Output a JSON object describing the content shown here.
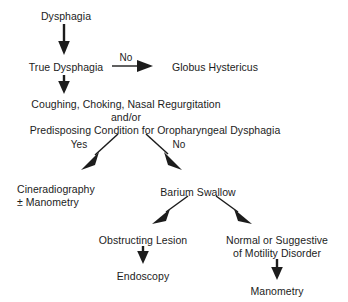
{
  "diagram": {
    "ink_color": "#1c1c1c",
    "background_color": "#ffffff",
    "nodes": [
      {
        "id": "dysphagia",
        "text": "Dysphagia",
        "x": 66,
        "y": 10,
        "align": "center"
      },
      {
        "id": "true-dysphagia",
        "text": "True Dysphagia",
        "x": 66,
        "y": 61,
        "align": "center"
      },
      {
        "id": "globus",
        "text": "Globus Hystericus",
        "x": 215,
        "y": 61,
        "align": "center"
      },
      {
        "id": "symptoms-line1",
        "text": "Coughing, Choking, Nasal Regurgitation",
        "x": 126,
        "y": 98,
        "align": "center"
      },
      {
        "id": "symptoms-line2",
        "text": "and/or",
        "x": 126,
        "y": 111,
        "align": "center"
      },
      {
        "id": "symptoms-line3",
        "text": "Predisposing Condition for Oropharyngeal Dysphagia",
        "x": 155,
        "y": 124,
        "align": "center"
      },
      {
        "id": "cineradiography",
        "text": "Cineradiography",
        "x": 17,
        "y": 183,
        "align": "left"
      },
      {
        "id": "manometry-pm",
        "text": "± Manometry",
        "x": 17,
        "y": 196,
        "align": "left"
      },
      {
        "id": "barium-swallow",
        "text": "Barium Swallow",
        "x": 198,
        "y": 186,
        "align": "center"
      },
      {
        "id": "obstructing",
        "text": "Obstructing Lesion",
        "x": 143,
        "y": 234,
        "align": "center"
      },
      {
        "id": "endoscopy",
        "text": "Endoscopy",
        "x": 143,
        "y": 270,
        "align": "center"
      },
      {
        "id": "normal-line1",
        "text": "Normal or Suggestive",
        "x": 277,
        "y": 234,
        "align": "center"
      },
      {
        "id": "normal-line2",
        "text": "of Motility Disorder",
        "x": 277,
        "y": 247,
        "align": "center"
      },
      {
        "id": "manometry",
        "text": "Manometry",
        "x": 277,
        "y": 285,
        "align": "center"
      }
    ],
    "edge_labels": [
      {
        "id": "no-globus",
        "text": "No",
        "x": 126,
        "y": 52
      },
      {
        "id": "yes-branch",
        "text": "Yes",
        "x": 79,
        "y": 139
      },
      {
        "id": "no-branch",
        "text": "No",
        "x": 179,
        "y": 139
      }
    ],
    "edges": [
      {
        "id": "dysphagia-to-true",
        "from": "dysphagia",
        "to": "true-dysphagia",
        "kind": "vertical",
        "label": ""
      },
      {
        "id": "true-to-globus",
        "from": "true-dysphagia",
        "to": "globus",
        "kind": "horizontal",
        "label": "No"
      },
      {
        "id": "true-to-symptoms",
        "from": "true-dysphagia",
        "to": "symptoms-line1",
        "kind": "vertical",
        "label": ""
      },
      {
        "id": "symptoms-to-cineradiography",
        "from": "symptoms-line3",
        "to": "cineradiography",
        "kind": "diagonal-left",
        "label": "Yes"
      },
      {
        "id": "symptoms-to-barium",
        "from": "symptoms-line3",
        "to": "barium-swallow",
        "kind": "diagonal-right",
        "label": "No"
      },
      {
        "id": "barium-to-obstructing",
        "from": "barium-swallow",
        "to": "obstructing",
        "kind": "diagonal-left",
        "label": ""
      },
      {
        "id": "barium-to-normal",
        "from": "barium-swallow",
        "to": "normal-line1",
        "kind": "diagonal-right",
        "label": ""
      },
      {
        "id": "obstructing-to-endoscopy",
        "from": "obstructing",
        "to": "endoscopy",
        "kind": "vertical",
        "label": ""
      },
      {
        "id": "normal-to-manometry",
        "from": "normal-line2",
        "to": "manometry",
        "kind": "vertical",
        "label": ""
      }
    ]
  }
}
